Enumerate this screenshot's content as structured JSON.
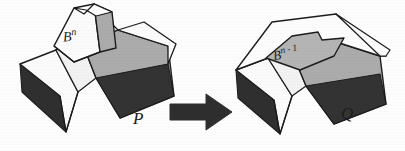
{
  "figure": {
    "caption_labels": {
      "left_solid": "P",
      "right_solid": "Q",
      "left_handle_base": "B",
      "left_handle_exp": "n",
      "right_patch_base": "B",
      "right_patch_exp": "n - 1"
    },
    "arrow": {
      "name": "transformation-arrow",
      "direction": "right"
    },
    "colors": {
      "background": "#fdfdfd",
      "outline": "#1c1c1c",
      "face_light": "#fbfbfb",
      "face_light_shadow": "#e8e8e8",
      "face_mid_gray": "#ababab",
      "face_gray_soft": "#bdbdbd",
      "face_dark": "#333333",
      "face_darkest": "#2b2b2b",
      "patch_gray": "#b4b4b4",
      "arrow_fill": "#2e2e2e",
      "label_color": "#1c1c1c"
    }
  }
}
